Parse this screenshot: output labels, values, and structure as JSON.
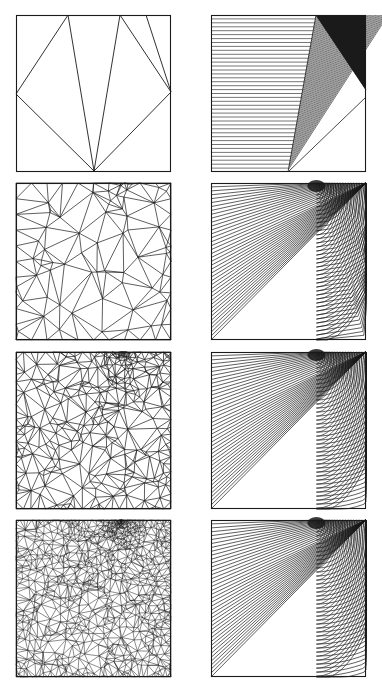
{
  "figure": {
    "description": "Adaptive mesh refinement sequence (left column) and corresponding solution contour plots (right column) on a unit square with a singularity near the top edge",
    "line_color": "#1a1a1a",
    "fill_dark": "#1a1a1a",
    "background": "#ffffff",
    "rows": [
      {
        "index": 1,
        "mesh": {
          "label": "initial-mesh",
          "kind": "coarse",
          "left": 16,
          "top": 15
        },
        "contour": {
          "label": "initial-solution-contours",
          "kind": "piecewise",
          "left": 211,
          "top": 15
        }
      },
      {
        "index": 2,
        "mesh": {
          "label": "refined-mesh-level-1",
          "kind": "refined",
          "points": 60,
          "left": 16,
          "top": 183
        },
        "contour": {
          "label": "solution-contours-level-1",
          "kind": "polyline",
          "left": 211,
          "top": 183
        }
      },
      {
        "index": 3,
        "mesh": {
          "label": "refined-mesh-level-2",
          "kind": "refined",
          "points": 260,
          "left": 16,
          "top": 352
        },
        "contour": {
          "label": "solution-contours-level-2",
          "kind": "smooth",
          "left": 211,
          "top": 352
        }
      },
      {
        "index": 4,
        "mesh": {
          "label": "refined-mesh-level-3",
          "kind": "refined",
          "points": 900,
          "left": 16,
          "top": 520
        },
        "contour": {
          "label": "solution-contours-level-3",
          "kind": "smooth",
          "left": 211,
          "top": 520
        }
      }
    ],
    "singularity": {
      "x": 0.68,
      "y": 0.0
    },
    "contour_levels": 40
  }
}
